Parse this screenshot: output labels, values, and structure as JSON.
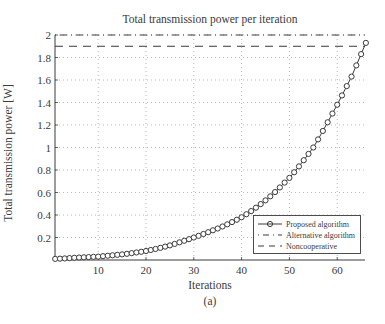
{
  "chart_data": {
    "type": "line",
    "title": "Total transmission power per iteration",
    "xlabel": "Iterations",
    "ylabel": "Total transmission power [W]",
    "caption": "(a)",
    "xlim": [
      1,
      66
    ],
    "ylim": [
      0,
      2
    ],
    "xticks": [
      10,
      20,
      30,
      40,
      50,
      60
    ],
    "xtick_labels": [
      "10",
      "20",
      "30",
      "40",
      "50",
      "60"
    ],
    "yticks": [
      0.2,
      0.4,
      0.6,
      0.8,
      1,
      1.2,
      1.4,
      1.6,
      1.8,
      2
    ],
    "ytick_labels": [
      "0.2",
      "0.4",
      "0.6",
      "0.8",
      "1",
      "1.2",
      "1.4",
      "1.6",
      "1.8",
      "2"
    ],
    "grid": true,
    "legend_position": "lower right",
    "x": [
      1,
      2,
      3,
      4,
      5,
      6,
      7,
      8,
      9,
      10,
      11,
      12,
      13,
      14,
      15,
      16,
      17,
      18,
      19,
      20,
      21,
      22,
      23,
      24,
      25,
      26,
      27,
      28,
      29,
      30,
      31,
      32,
      33,
      34,
      35,
      36,
      37,
      38,
      39,
      40,
      41,
      42,
      43,
      44,
      45,
      46,
      47,
      48,
      49,
      50,
      51,
      52,
      53,
      54,
      55,
      56,
      57,
      58,
      59,
      60,
      61,
      62,
      63,
      64,
      65,
      66
    ],
    "series": [
      {
        "name": "Proposed algorithm",
        "style": "solid line with circle markers",
        "values": [
          0.01,
          0.012,
          0.014,
          0.017,
          0.02,
          0.022,
          0.024,
          0.026,
          0.028,
          0.03,
          0.034,
          0.038,
          0.042,
          0.046,
          0.05,
          0.055,
          0.061,
          0.067,
          0.073,
          0.08,
          0.089,
          0.098,
          0.108,
          0.119,
          0.13,
          0.143,
          0.157,
          0.171,
          0.185,
          0.2,
          0.215,
          0.231,
          0.247,
          0.264,
          0.28,
          0.298,
          0.317,
          0.337,
          0.358,
          0.38,
          0.407,
          0.435,
          0.465,
          0.497,
          0.53,
          0.566,
          0.604,
          0.645,
          0.688,
          0.73,
          0.78,
          0.832,
          0.887,
          0.943,
          1.0,
          1.072,
          1.147,
          1.224,
          1.302,
          1.38,
          1.463,
          1.546,
          1.63,
          1.73,
          1.83,
          1.93
        ]
      },
      {
        "name": "Alternative algorithm",
        "style": "dash-dot line",
        "constant_value": 2.0
      },
      {
        "name": "Noncooperative",
        "style": "dashed line",
        "constant_value": 1.9
      }
    ]
  },
  "colors": {
    "line": "#3a3a3a",
    "grid": "#9a9a9a",
    "background": "#ffffff"
  }
}
